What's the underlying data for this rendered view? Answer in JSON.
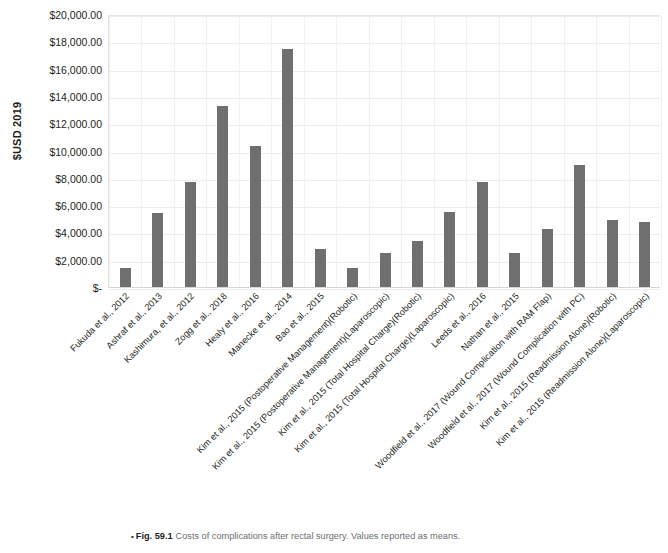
{
  "figure": {
    "caption_bullet": "•",
    "caption_label": "Fig. 59.1",
    "caption_text": "Costs of complications after rectal surgery. Values reported as means."
  },
  "colors": {
    "bar": "#6f6f6f",
    "grid": "#ececec",
    "text": "#231f20",
    "caption": "#6d6e71"
  },
  "chart_data": {
    "type": "bar",
    "title": "",
    "xlabel": "",
    "ylabel": "$USD 2019",
    "ylim": [
      0,
      20000
    ],
    "ytick_values": [
      0,
      2000,
      4000,
      6000,
      8000,
      10000,
      12000,
      14000,
      16000,
      18000,
      20000
    ],
    "ytick_labels": [
      "$-",
      "$2,000.00",
      "$4,000.00",
      "$6,000.00",
      "$8,000.00",
      "$10,000.00",
      "$12,000.00",
      "$14,000.00",
      "$16,000.00",
      "$18,000.00",
      "$20,000.00"
    ],
    "grid": true,
    "legend": false,
    "categories": [
      "Fukuda et al., 2012",
      "Ashraf et al., 2013",
      "Kashimura, et al., 2012",
      "Zogg et al., 2018",
      "Healy et al., 2016",
      "Manecke et al., 2014",
      "Bao et al., 2015",
      "Kim et al., 2015 (Postoperative Management)(Robotic)",
      "Kim et al., 2015 (Postoperative Management)(Laparoscopic)",
      "Kim et al., 2015 (Total Hospital Charge)(Robotic)",
      "Kim et al., 2015 (Total Hospital Charge)(Laparoscopic)",
      "Leeds et al., 2016",
      "Nathan et al., 2015",
      "Woodfield et al., 2017 (Wound Complication with RAM Flap)",
      "Woodfield et al., 2017 (Wound Complication with PC)",
      "Kim et al., 2015 (Readmission Alone)(Robotic)",
      "Kim et al., 2015 (Readmission Alone)(Laparoscopic)"
    ],
    "values": [
      1500,
      5500,
      7750,
      13350,
      10400,
      17500,
      2850,
      1500,
      2600,
      3450,
      5600,
      7750,
      2550,
      4300,
      9000,
      5000,
      4850
    ]
  }
}
